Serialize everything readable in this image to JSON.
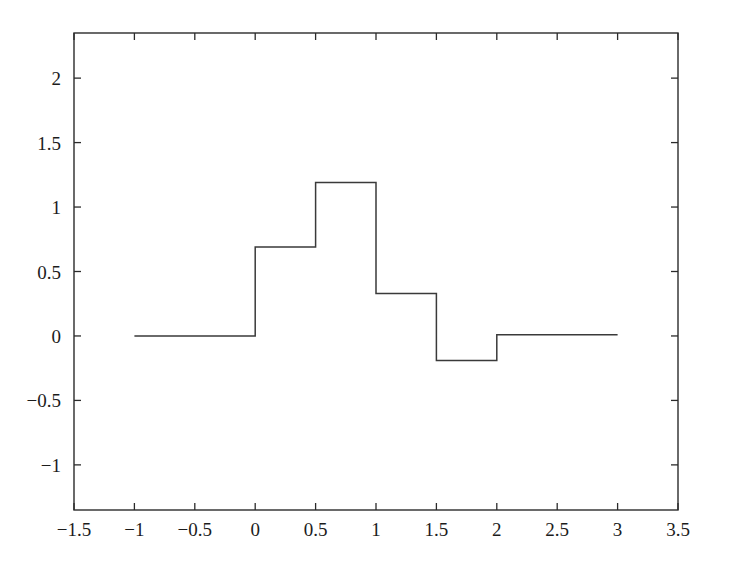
{
  "chart_data": {
    "type": "line",
    "subtype": "step-post",
    "title": "",
    "subtitle": "",
    "xlabel": "",
    "ylabel": "",
    "xlim": [
      -1.5,
      3.5
    ],
    "ylim": [
      -1.35,
      2.35
    ],
    "grid": false,
    "legend": null,
    "legend_position": "none",
    "box_frame": true,
    "tick_direction": "in",
    "xticks": [
      -1.5,
      -1,
      -0.5,
      0,
      0.5,
      1,
      1.5,
      2,
      2.5,
      3,
      3.5
    ],
    "xtick_labels": [
      "-1.5",
      "-1",
      "-0.5",
      "0",
      "0.5",
      "1",
      "1.5",
      "2",
      "2.5",
      "3",
      "3.5"
    ],
    "yticks": [
      -1,
      -0.5,
      0,
      0.5,
      1,
      1.5,
      2
    ],
    "ytick_labels": [
      "-1",
      "-0.5",
      "0",
      "0.5",
      "1",
      "1.5",
      "2"
    ],
    "series": [
      {
        "name": "step-signal",
        "color": "#3a3a3a",
        "x_edges": [
          -1,
          0,
          0.5,
          1,
          1.5,
          2,
          3
        ],
        "values": [
          0,
          0.69,
          1.19,
          0.33,
          -0.19,
          0.01
        ],
        "segments": [
          {
            "x_start": -1,
            "x_end": 0,
            "y": 0
          },
          {
            "x_start": 0,
            "x_end": 0.5,
            "y": 0.69
          },
          {
            "x_start": 0.5,
            "x_end": 1,
            "y": 1.19
          },
          {
            "x_start": 1,
            "x_end": 1.5,
            "y": 0.33
          },
          {
            "x_start": 1.5,
            "x_end": 2,
            "y": -0.19
          },
          {
            "x_start": 2,
            "x_end": 3,
            "y": 0.01
          }
        ]
      }
    ],
    "annotations": []
  }
}
